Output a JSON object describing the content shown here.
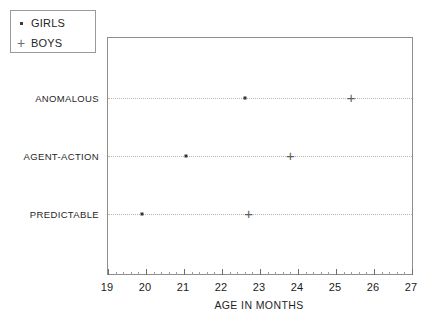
{
  "legend": {
    "position": "top-left-outside",
    "entries": [
      {
        "marker": "dot-marker-icon",
        "label": "GIRLS"
      },
      {
        "marker": "plus-marker-icon",
        "label": "BOYS"
      }
    ]
  },
  "axes": {
    "xlabel": "AGE IN MONTHS",
    "xticks": [
      "19",
      "20",
      "21",
      "22",
      "23",
      "24",
      "25",
      "26",
      "27"
    ],
    "ycategories": [
      "ANOMALOUS",
      "AGENT-ACTION",
      "PREDICTABLE"
    ]
  },
  "chart_data": {
    "type": "scatter",
    "title": "",
    "xlabel": "AGE IN MONTHS",
    "ylabel": "",
    "xlim": [
      19,
      27
    ],
    "xticks": [
      19,
      20,
      21,
      22,
      23,
      24,
      25,
      26,
      27
    ],
    "grid": true,
    "legend_position": "upper left outside",
    "categories": [
      "PREDICTABLE",
      "AGENT-ACTION",
      "ANOMALOUS"
    ],
    "series": [
      {
        "name": "GIRLS",
        "marker": "dot",
        "color": "#333333",
        "points": [
          {
            "category": "PREDICTABLE",
            "x": 19.9
          },
          {
            "category": "AGENT-ACTION",
            "x": 21.05
          },
          {
            "category": "ANOMALOUS",
            "x": 22.6
          }
        ]
      },
      {
        "name": "BOYS",
        "marker": "plus",
        "color": "#5e5e5e",
        "points": [
          {
            "category": "PREDICTABLE",
            "x": 22.7
          },
          {
            "category": "AGENT-ACTION",
            "x": 23.8
          },
          {
            "category": "ANOMALOUS",
            "x": 25.4
          }
        ]
      }
    ]
  }
}
